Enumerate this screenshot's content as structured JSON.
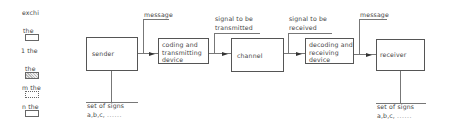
{
  "legend": {
    "items": [
      {
        "label": "exchi",
        "box": null
      },
      {
        "label": "the",
        "box": "plain"
      },
      {
        "label": "1 the",
        "box": null
      },
      {
        "label": "the",
        "box": "hatched"
      },
      {
        "label": "m the",
        "box": "dotted"
      },
      {
        "label": "n the",
        "box": "plain"
      }
    ]
  },
  "diagram": {
    "nodes": [
      {
        "id": "sender",
        "lines": [
          "sender"
        ]
      },
      {
        "id": "coding",
        "lines": [
          "coding and",
          "transmitting",
          "device"
        ]
      },
      {
        "id": "channel",
        "lines": [
          "channel"
        ]
      },
      {
        "id": "decoding",
        "lines": [
          "decoding and",
          "receiving",
          "device"
        ]
      },
      {
        "id": "receiver",
        "lines": [
          "receiver"
        ]
      }
    ],
    "edge_labels": [
      {
        "from": "sender",
        "to": "coding",
        "lines": [
          "message"
        ]
      },
      {
        "from": "coding",
        "to": "channel",
        "lines": [
          "signal to be",
          "transmitted"
        ]
      },
      {
        "from": "channel",
        "to": "decoding",
        "lines": [
          "signal to be",
          "received"
        ]
      },
      {
        "from": "decoding",
        "to": "receiver",
        "lines": [
          "message"
        ]
      }
    ],
    "sign_sets": [
      {
        "attached_to": "sender",
        "line1": "set of signs",
        "line2": "a,b,c,",
        "ellipsis": "......"
      },
      {
        "attached_to": "receiver",
        "line1": "set of signs",
        "line2": "a,b,c,",
        "ellipsis": "......"
      }
    ]
  }
}
